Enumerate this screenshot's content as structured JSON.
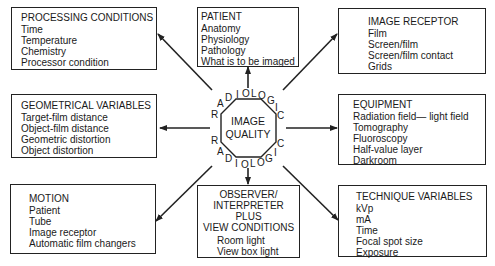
{
  "center": {
    "title_line1": "IMAGE",
    "title_line2": "QUALITY",
    "ring_word_top": "RADIOLOGIC",
    "ring_word_bottom": "RADIOLOGIC"
  },
  "boxes": {
    "processing_conditions": {
      "title": "PROCESSING CONDITIONS",
      "items": [
        "Time",
        "Temperature",
        "Chemistry",
        "Processor condition"
      ]
    },
    "patient": {
      "title": "PATIENT",
      "items": [
        "Anatomy",
        "Physiology",
        "Pathology",
        "What is to be imaged"
      ]
    },
    "image_receptor": {
      "title": "IMAGE RECEPTOR",
      "items": [
        "Film",
        "Screen/film",
        "Screen/film contact",
        "Grids"
      ]
    },
    "geometrical_variables": {
      "title": "GEOMETRICAL VARIABLES",
      "items": [
        "Target-film distance",
        "Object-film distance",
        "Geometric distortion",
        "Object distortion"
      ]
    },
    "equipment": {
      "title": "EQUIPMENT",
      "items": [
        "Radiation field— light field",
        "Tomography",
        "Fluoroscopy",
        "Half-value layer",
        "Darkroom"
      ]
    },
    "motion": {
      "title": "MOTION",
      "items": [
        "Patient",
        "Tube",
        "Image receptor",
        "Automatic film changers"
      ]
    },
    "observer": {
      "title_lines": [
        "OBSERVER/",
        "INTERPRETER",
        "PLUS",
        "VIEW CONDITIONS"
      ],
      "items": [
        "Room light",
        "View box light"
      ]
    },
    "technique_variables": {
      "title": "TECHNIQUE VARIABLES",
      "items": [
        "kVp",
        "mA",
        "Time",
        "Focal spot size",
        "Exposure"
      ]
    }
  }
}
